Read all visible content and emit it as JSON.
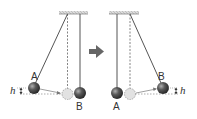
{
  "diagram": {
    "type": "pendulum-collision",
    "colors": {
      "string": "#555555",
      "dashed": "#777777",
      "ceiling": "#bbbbbb",
      "ball_fill": "#4a4a4a",
      "ghost_fill": "#e0e0e0",
      "arrow": "#666666"
    },
    "before": {
      "label_a": "A",
      "label_b": "B",
      "label_h": "h"
    },
    "transition_arrow": "➜",
    "after": {
      "label_a": "A",
      "label_b": "B",
      "label_h": "h"
    }
  }
}
